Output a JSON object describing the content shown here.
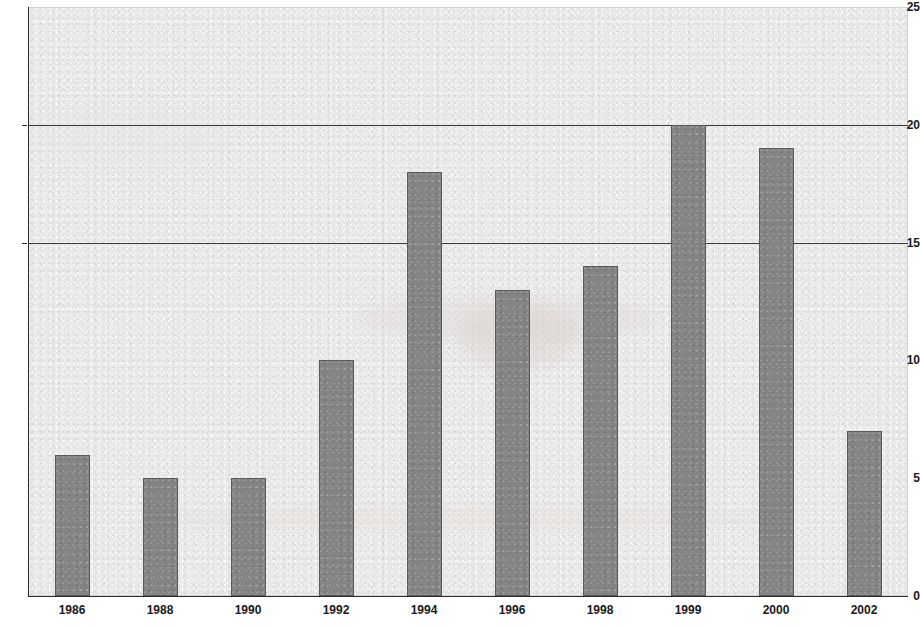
{
  "chart_data": {
    "type": "bar",
    "title": "",
    "subtitle": "",
    "xlabel": "",
    "ylabel": "",
    "categories": [
      "1986",
      "1988",
      "1990",
      "1992",
      "1994",
      "1996",
      "1998",
      "1999",
      "2000",
      "2002"
    ],
    "values": [
      6,
      5,
      5,
      10,
      18,
      13,
      14,
      20,
      19,
      7
    ],
    "series": [
      {
        "name": "",
        "values": [
          6,
          5,
          5,
          10,
          18,
          13,
          14,
          20,
          19,
          7
        ]
      }
    ],
    "ylim": [
      0,
      25
    ],
    "y_ticks": [
      0,
      5,
      10,
      15,
      20,
      25
    ],
    "y_tick_labels": [
      "0",
      "5",
      "10",
      "15",
      "20",
      "25"
    ],
    "x_tick_labels": [
      "1986",
      "1988",
      "1990",
      "1992",
      "1994",
      "1996",
      "1998",
      "1999",
      "2000",
      "2002"
    ],
    "gridlines": {
      "visible_at": [
        15,
        20
      ],
      "axis": "y"
    },
    "legend": {
      "visible": false,
      "entries": []
    },
    "annotations": [],
    "colors": {
      "bar_fill": "#848484",
      "bar_border": "#5a5a5a",
      "plot_background": "#e9e9e9",
      "page_background": "#ffffff",
      "axis": "#2b2b2b",
      "gridline": "#3a3a3a",
      "tick_label": "#1a1a1a"
    }
  }
}
